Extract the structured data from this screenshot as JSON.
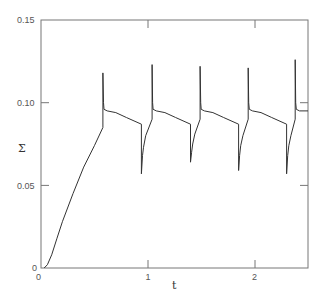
{
  "chart_data": {
    "type": "line",
    "title": "",
    "xlabel": "t",
    "ylabel": "Σ",
    "xlim": [
      0,
      2.5
    ],
    "ylim": [
      0,
      0.15
    ],
    "grid": false,
    "legend": null,
    "x_ticks": [
      {
        "value": 0,
        "label": "0"
      },
      {
        "value": 1,
        "label": "1"
      },
      {
        "value": 2,
        "label": "2"
      }
    ],
    "y_ticks": [
      {
        "value": 0,
        "label": "0"
      },
      {
        "value": 0.05,
        "label": "0.05"
      },
      {
        "value": 0.1,
        "label": "0.10"
      },
      {
        "value": 0.15,
        "label": "0.15"
      }
    ],
    "series": [
      {
        "name": "Σ(t)",
        "color": "#333333",
        "x": [
          0.03,
          0.06,
          0.1,
          0.15,
          0.2,
          0.3,
          0.4,
          0.5,
          0.58,
          0.58,
          0.585,
          0.59,
          0.62,
          0.7,
          0.8,
          0.94,
          0.94,
          0.95,
          0.96,
          0.98,
          1.04,
          1.04,
          1.045,
          1.05,
          1.08,
          1.16,
          1.26,
          1.4,
          1.4,
          1.41,
          1.42,
          1.44,
          1.49,
          1.49,
          1.495,
          1.5,
          1.53,
          1.61,
          1.71,
          1.85,
          1.85,
          1.86,
          1.87,
          1.89,
          1.94,
          1.94,
          1.945,
          1.95,
          1.98,
          2.06,
          2.16,
          2.3,
          2.3,
          2.31,
          2.32,
          2.34,
          2.38,
          2.38,
          2.385,
          2.39,
          2.42,
          2.5
        ],
        "y": [
          0.0,
          0.002,
          0.008,
          0.018,
          0.028,
          0.045,
          0.061,
          0.074,
          0.085,
          0.118,
          0.1,
          0.096,
          0.095,
          0.094,
          0.091,
          0.087,
          0.057,
          0.068,
          0.073,
          0.08,
          0.09,
          0.123,
          0.1,
          0.096,
          0.095,
          0.094,
          0.091,
          0.087,
          0.064,
          0.07,
          0.075,
          0.081,
          0.09,
          0.122,
          0.1,
          0.096,
          0.095,
          0.094,
          0.091,
          0.087,
          0.059,
          0.068,
          0.074,
          0.08,
          0.09,
          0.121,
          0.1,
          0.096,
          0.095,
          0.094,
          0.091,
          0.087,
          0.057,
          0.068,
          0.074,
          0.08,
          0.09,
          0.126,
          0.1,
          0.096,
          0.095,
          0.095
        ]
      }
    ],
    "annotations": []
  },
  "axes": {
    "origin_x_label": "0",
    "origin_y_label": "0",
    "x_tick_1": "1",
    "x_tick_2": "2",
    "y_tick_005": "0.05",
    "y_tick_010": "0.10",
    "y_tick_015": "0.15",
    "xlabel": "t",
    "ylabel": "Σ"
  }
}
